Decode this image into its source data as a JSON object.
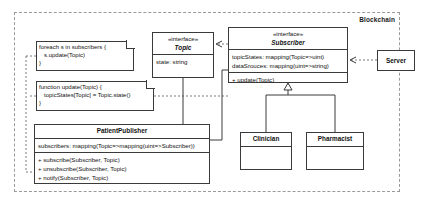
{
  "diagram": {
    "package": {
      "label": "Blockchain"
    },
    "notes": [
      {
        "name": "note-foreach",
        "text": "foreach s in subscribers {\n   s.update(Topic)\n}"
      },
      {
        "name": "note-update",
        "text": "function update(Topic) {\n   topicStates[Topic] = Topic.state()\n}"
      }
    ],
    "classes": {
      "topic": {
        "stereotype": "«interface»",
        "name": "Topic",
        "attributes": [
          "state: string"
        ],
        "operations": []
      },
      "subscriber": {
        "stereotype": "«interface»",
        "name": "Subscriber",
        "attributes": [
          "topicStates: mapping(Topic=>uint)",
          "dataSrouces: mapping(uint=>string)"
        ],
        "operations": [
          "+ update(Topic)"
        ]
      },
      "patient_publisher": {
        "name": "PatientPublisher",
        "attributes": [
          "subscribers: mapping(Topic=>mapping(uint=>Subscriber))"
        ],
        "operations": [
          "+ subscribe(Subscriber, Topic)",
          "+ unsubscribe(Subscriber, Topic)",
          "+ notify(Subscriber, Topic)"
        ]
      },
      "clinician": {
        "name": "Clinician",
        "attributes": [],
        "operations": []
      },
      "pharmacist": {
        "name": "Pharmacist",
        "attributes": [],
        "operations": []
      },
      "server": {
        "name": "Server"
      }
    },
    "colors": {
      "stroke": "#3a3a3a",
      "dashed_stroke": "#7a7a7a",
      "background": "#ffffff",
      "text": "#111111"
    }
  }
}
